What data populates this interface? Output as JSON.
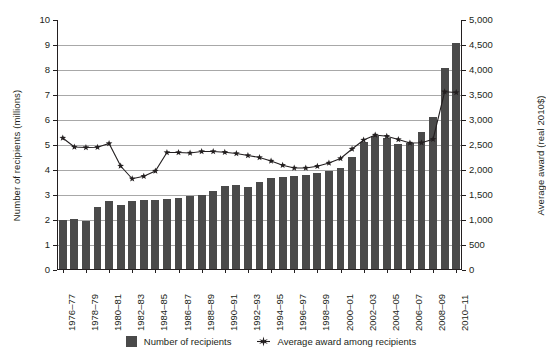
{
  "chart_data": {
    "type": "bar",
    "title": "",
    "subtitle": "",
    "xlabel": "",
    "ylabel": "Number of recipients (millions)",
    "ylabel_right": "Average award (real 2010$)",
    "ylim": [
      0,
      10
    ],
    "ylim_right": [
      0,
      5000
    ],
    "yticks": [
      "0",
      "1",
      "2",
      "3",
      "4",
      "5",
      "6",
      "7",
      "8",
      "9",
      "10"
    ],
    "ytick_values": [
      0,
      1,
      2,
      3,
      4,
      5,
      6,
      7,
      8,
      9,
      10
    ],
    "yticks_right": [
      "0",
      "500",
      "1,000",
      "1,500",
      "2,000",
      "2,500",
      "3,000",
      "3,500",
      "4,000",
      "4,500",
      "5,000"
    ],
    "ytick_values_right": [
      0,
      500,
      1000,
      1500,
      2000,
      2500,
      3000,
      3500,
      4000,
      4500,
      5000
    ],
    "grid": true,
    "legend_position": "bottom",
    "x": [
      "1976-77",
      "1977-78",
      "1978-79",
      "1979-80",
      "1980-81",
      "1981-82",
      "1982-83",
      "1983-84",
      "1984-85",
      "1985-86",
      "1986-87",
      "1987-88",
      "1988-89",
      "1989-90",
      "1990-91",
      "1991-92",
      "1992-93",
      "1993-94",
      "1994-95",
      "1995-96",
      "1996-97",
      "1997-98",
      "1998-99",
      "1999-00",
      "2000-01",
      "2001-02",
      "2002-03",
      "2003-04",
      "2004-05",
      "2005-06",
      "2006-07",
      "2007-08",
      "2008-09",
      "2009-10",
      "2010-11"
    ],
    "xtick_labels": [
      "1976–77",
      "1978–79",
      "1980–81",
      "1982–83",
      "1984–85",
      "1986–87",
      "1988–89",
      "1990–91",
      "1992–93",
      "1994–95",
      "1996–97",
      "1998–99",
      "2000–01",
      "2002–03",
      "2004–05",
      "2006–07",
      "2008–09",
      "2010–11"
    ],
    "xtick_indices": [
      0,
      2,
      4,
      6,
      8,
      10,
      12,
      14,
      16,
      18,
      20,
      22,
      24,
      26,
      28,
      30,
      32,
      34
    ],
    "series": [
      {
        "name": "Number of recipients",
        "kind": "bar",
        "axis": "left",
        "unit": "millions",
        "color": "#4a4a4a",
        "values": [
          2.02,
          2.05,
          1.95,
          2.53,
          2.78,
          2.6,
          2.78,
          2.8,
          2.82,
          2.86,
          2.88,
          2.95,
          3.02,
          3.16,
          3.35,
          3.42,
          3.31,
          3.52,
          3.68,
          3.72,
          3.78,
          3.8,
          3.88,
          3.95,
          4.1,
          4.52,
          5.12,
          5.35,
          5.28,
          5.05,
          5.1,
          5.52,
          6.12,
          8.1,
          9.1
        ]
      },
      {
        "name": "Average award among recipients",
        "kind": "line",
        "axis": "right",
        "unit": "real 2010$",
        "color": "#231f20",
        "marker": "star",
        "values": [
          2640,
          2460,
          2450,
          2455,
          2530,
          2080,
          1825,
          1875,
          1980,
          2350,
          2350,
          2340,
          2370,
          2370,
          2355,
          2330,
          2290,
          2250,
          2180,
          2095,
          2040,
          2040,
          2075,
          2140,
          2230,
          2420,
          2600,
          2700,
          2675,
          2610,
          2540,
          2545,
          2615,
          3565,
          3550
        ]
      }
    ]
  },
  "legend": {
    "items": [
      {
        "label": "Number of recipients",
        "marker": "square"
      },
      {
        "label": "Average award among recipients",
        "marker": "star"
      }
    ]
  }
}
